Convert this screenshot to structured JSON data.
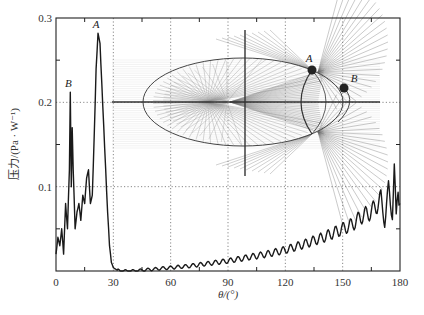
{
  "chart_data": {
    "type": "line",
    "title": "",
    "xlabel": "θ/(°)",
    "ylabel": "压力/(Pa · W⁻¹)",
    "xlim": [
      0,
      180
    ],
    "ylim": [
      0,
      0.3
    ],
    "xticks": [
      0,
      30,
      60,
      90,
      120,
      150,
      180
    ],
    "xtick_labels": [
      "0",
      "30",
      "60",
      "90",
      "120",
      "150",
      "180"
    ],
    "yticks": [
      0.1,
      0.2,
      0.3
    ],
    "ytick_labels": [
      "0.1",
      "0.2",
      "0.3"
    ],
    "grid": "dotted at x=30,60,90,120,150 and y=0.1,0.2",
    "legend": null,
    "annotations": [
      {
        "label": "A",
        "x": 22,
        "y": 0.282,
        "note": "main peak"
      },
      {
        "label": "B",
        "x": 7.5,
        "y": 0.212,
        "note": "secondary peak"
      }
    ],
    "series": [
      {
        "name": "pressure",
        "x": [
          0,
          1,
          2,
          3,
          4,
          5,
          6,
          7,
          7.5,
          8,
          8.5,
          9,
          10,
          11,
          12,
          13,
          14,
          15,
          16,
          17,
          18,
          19,
          20,
          21,
          22,
          23,
          24,
          25,
          26,
          27,
          28,
          29,
          30,
          32,
          35,
          40,
          45,
          50,
          60,
          70,
          80,
          90,
          100,
          110,
          120,
          130,
          140,
          150,
          155,
          160,
          165,
          170,
          172,
          174,
          176,
          177,
          178,
          179,
          180
        ],
        "y": [
          0.02,
          0.04,
          0.03,
          0.05,
          0.02,
          0.08,
          0.05,
          0.12,
          0.212,
          0.1,
          0.17,
          0.12,
          0.05,
          0.07,
          0.08,
          0.06,
          0.09,
          0.08,
          0.11,
          0.12,
          0.08,
          0.09,
          0.16,
          0.24,
          0.282,
          0.27,
          0.22,
          0.17,
          0.12,
          0.07,
          0.03,
          0.01,
          0.004,
          0.001,
          0.0,
          0.0,
          0.001,
          0.002,
          0.004,
          0.006,
          0.009,
          0.012,
          0.016,
          0.02,
          0.025,
          0.032,
          0.04,
          0.05,
          0.055,
          0.065,
          0.07,
          0.085,
          0.06,
          0.095,
          0.07,
          0.12,
          0.06,
          0.1,
          0.08
        ]
      }
    ],
    "inset": {
      "description": "Ray-tracing diagram of ellipsoidal reflector with focal points; rays converging to caustic near points A and B",
      "labels": [
        "A",
        "B"
      ]
    }
  }
}
